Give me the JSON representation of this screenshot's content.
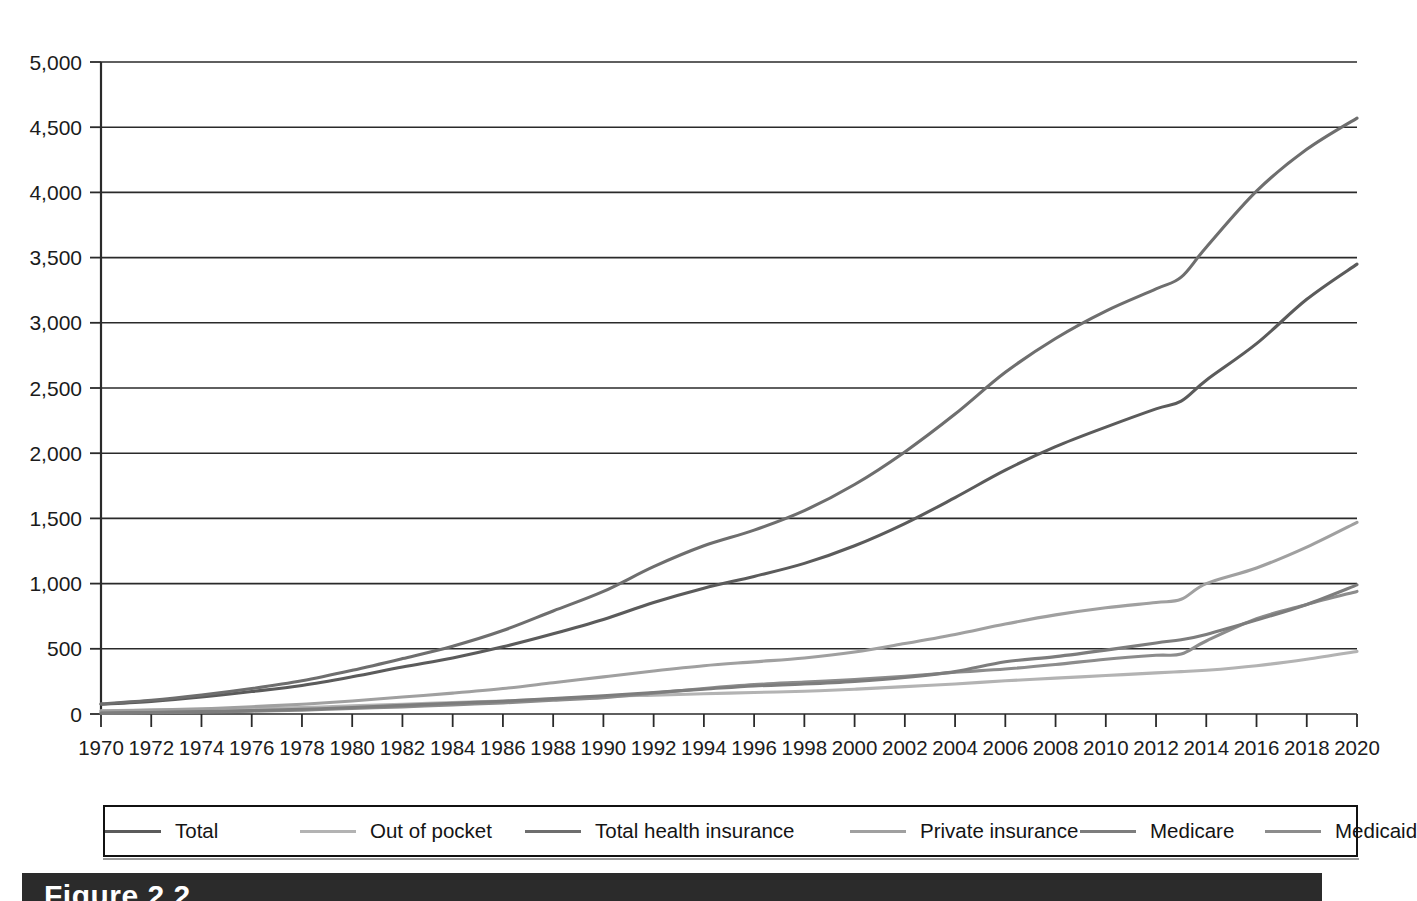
{
  "figure": {
    "caption_label": "Figure 2.2",
    "banner_color": "#2b2b2b"
  },
  "legend": {
    "position": "below-axis",
    "entries": [
      {
        "label": "Total",
        "color": "#5b5b5b"
      },
      {
        "label": "Out of pocket",
        "color": "#b3b3b3"
      },
      {
        "label": "Total health insurance",
        "color": "#6e6e6e"
      },
      {
        "label": "Private insurance",
        "color": "#a0a0a0"
      },
      {
        "label": "Medicare",
        "color": "#7d7d7d"
      },
      {
        "label": "Medicaid",
        "color": "#8c8c8c"
      }
    ]
  },
  "axes": {
    "y_ticks": [
      "0",
      "500",
      "1,000",
      "1,500",
      "2,000",
      "2,500",
      "3,000",
      "3,500",
      "4,000",
      "4,500",
      "5,000"
    ],
    "x_ticks": [
      "1970",
      "1972",
      "1974",
      "1976",
      "1978",
      "1980",
      "1982",
      "1984",
      "1986",
      "1988",
      "1990",
      "1992",
      "1994",
      "1996",
      "1998",
      "2000",
      "2002",
      "2004",
      "2006",
      "2008",
      "2010",
      "2012",
      "2014",
      "2016",
      "2018",
      "2020"
    ]
  },
  "chart_data": {
    "type": "line",
    "title": "",
    "subtitle": "",
    "xlabel": "",
    "ylabel": "",
    "xlim": [
      1970,
      2020
    ],
    "ylim": [
      0,
      5000
    ],
    "y_tick_step": 500,
    "x_tick_step": 2,
    "grid": true,
    "legend_position": "bottom",
    "x": [
      1970,
      1972,
      1974,
      1976,
      1978,
      1980,
      1982,
      1984,
      1986,
      1988,
      1990,
      1992,
      1994,
      1996,
      1998,
      2000,
      2002,
      2004,
      2006,
      2008,
      2010,
      2012,
      2013,
      2014,
      2016,
      2018,
      2020
    ],
    "series": [
      {
        "name": "Total",
        "color": "#5b5b5b",
        "values": [
          75,
          97,
          130,
          172,
          219,
          285,
          360,
          430,
          515,
          615,
          725,
          855,
          965,
          1055,
          1155,
          1290,
          1460,
          1660,
          1870,
          2050,
          2200,
          2340,
          2400,
          2560,
          2840,
          3180,
          3450
        ]
      },
      {
        "name": "Out of pocket",
        "color": "#b3b3b3",
        "values": [
          25,
          30,
          35,
          42,
          50,
          62,
          75,
          88,
          100,
          115,
          135,
          145,
          155,
          165,
          175,
          190,
          210,
          230,
          255,
          275,
          295,
          315,
          325,
          335,
          370,
          420,
          480
        ]
      },
      {
        "name": "Total health insurance",
        "color": "#6e6e6e",
        "values": [
          78,
          105,
          145,
          195,
          255,
          335,
          425,
          520,
          640,
          790,
          940,
          1130,
          1290,
          1410,
          1560,
          1760,
          2010,
          2300,
          2620,
          2880,
          3090,
          3260,
          3350,
          3580,
          4010,
          4330,
          4570
        ]
      },
      {
        "name": "Private insurance",
        "color": "#a0a0a0",
        "values": [
          22,
          30,
          40,
          56,
          75,
          100,
          130,
          160,
          195,
          240,
          285,
          330,
          370,
          400,
          430,
          475,
          540,
          610,
          690,
          760,
          815,
          855,
          880,
          1000,
          1120,
          1280,
          1470
        ]
      },
      {
        "name": "Medicare",
        "color": "#7d7d7d",
        "values": [
          8,
          12,
          18,
          26,
          36,
          50,
          66,
          82,
          98,
          118,
          140,
          165,
          190,
          215,
          230,
          250,
          280,
          325,
          400,
          440,
          490,
          545,
          570,
          610,
          720,
          840,
          990
        ]
      },
      {
        "name": "Medicaid",
        "color": "#8c8c8c",
        "values": [
          6,
          10,
          15,
          22,
          30,
          42,
          55,
          70,
          85,
          105,
          125,
          160,
          195,
          225,
          245,
          265,
          290,
          320,
          345,
          380,
          420,
          450,
          460,
          560,
          730,
          840,
          940
        ]
      }
    ]
  }
}
